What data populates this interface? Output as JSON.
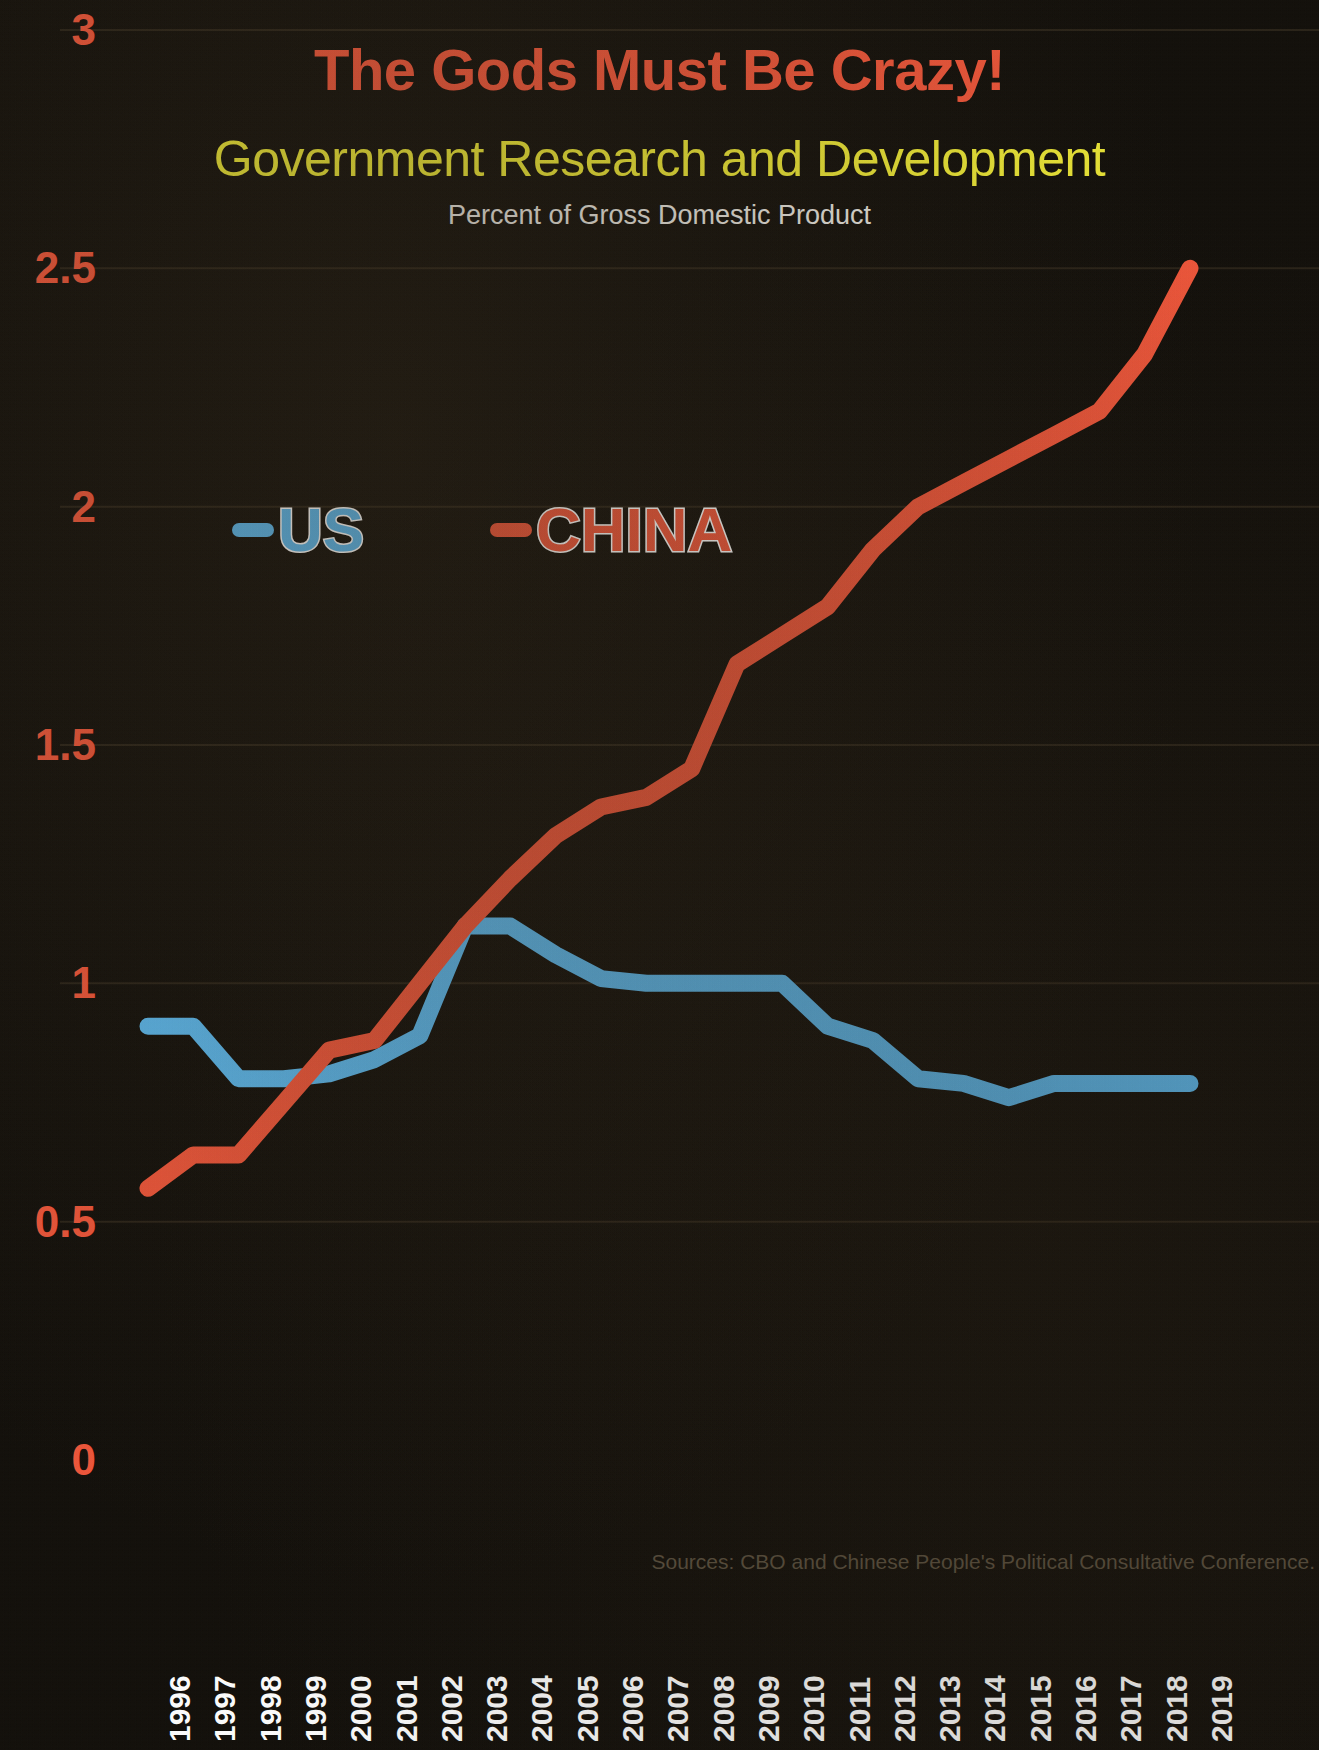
{
  "header": {
    "title": "The Gods Must Be Crazy!",
    "subtitle": "Government Research and Development",
    "subsubtitle": "Percent of Gross Domestic Product"
  },
  "source_note": "Sources: CBO and Chinese People's Political Consultative Conference.",
  "colors": {
    "background": "#120f0a",
    "title": "#f0563a",
    "subtitle": "#ece736",
    "subsubtitle": "#e8e6e0",
    "axis_label": "#f0563a",
    "x_label": "#ffffff",
    "us_line": "#5bb8ee",
    "china_line": "#f0563a",
    "source_text": "#5a503f",
    "gridline": "#2a2318"
  },
  "chart_data": {
    "type": "line",
    "title": "Government Research and Development",
    "subtitle": "Percent of Gross Domestic Product",
    "xlabel": "",
    "ylabel": "",
    "ylim": [
      0,
      3
    ],
    "yticks": [
      "0",
      "0.5",
      "1",
      "1.5",
      "2",
      "2.5",
      "3"
    ],
    "ytick_values": [
      0,
      0.5,
      1,
      1.5,
      2,
      2.5,
      3
    ],
    "grid": true,
    "legend_position": "upper-left-inside",
    "categories": [
      "1996",
      "1997",
      "1998",
      "1999",
      "2000",
      "2001",
      "2002",
      "2003",
      "2004",
      "2005",
      "2006",
      "2007",
      "2008",
      "2009",
      "2010",
      "2011",
      "2012",
      "2013",
      "2014",
      "2015",
      "2016",
      "2017",
      "2018",
      "2019"
    ],
    "series": [
      {
        "name": "US",
        "color": "#5bb8ee",
        "values": [
          0.91,
          0.91,
          0.8,
          0.8,
          0.81,
          0.84,
          0.89,
          1.12,
          1.12,
          1.06,
          1.01,
          1.0,
          1.0,
          1.0,
          1.0,
          0.91,
          0.88,
          0.8,
          0.79,
          0.76,
          0.79,
          0.79,
          0.79,
          0.79
        ]
      },
      {
        "name": "CHINA",
        "color": "#f0563a",
        "values": [
          0.57,
          0.64,
          0.64,
          0.75,
          0.86,
          0.88,
          1.0,
          1.12,
          1.22,
          1.31,
          1.37,
          1.39,
          1.45,
          1.67,
          1.73,
          1.79,
          1.91,
          2.0,
          2.05,
          2.1,
          2.15,
          2.2,
          2.32,
          2.5
        ]
      }
    ]
  },
  "legend": {
    "items": [
      {
        "label": "US",
        "color": "#5bb8ee"
      },
      {
        "label": "CHINA",
        "color": "#f0563a"
      }
    ]
  }
}
